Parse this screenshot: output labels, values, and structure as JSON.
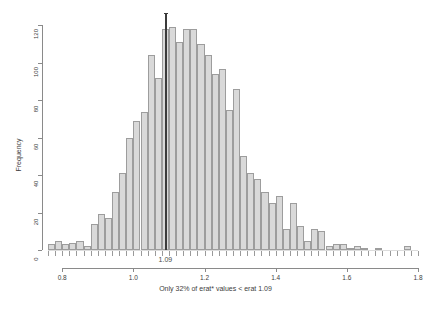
{
  "chart_data": {
    "type": "bar",
    "title": "",
    "subtitle": "",
    "xlabel": "Only 32% of erat* values < erat 1.09",
    "ylabel": "Frequency",
    "xlim": [
      0.76,
      1.8
    ],
    "ylim": [
      0,
      124
    ],
    "grid": false,
    "legend": null,
    "bin_width": 0.02,
    "x_ticks": [
      "0.8",
      "1.0",
      "1.2",
      "1.4",
      "1.6",
      "1.8"
    ],
    "x_tick_values": [
      0.8,
      1.0,
      1.2,
      1.4,
      1.6,
      1.8
    ],
    "y_ticks": [
      "0",
      "20",
      "40",
      "60",
      "80",
      "100",
      "120"
    ],
    "y_tick_values": [
      0,
      20,
      40,
      60,
      80,
      100,
      120
    ],
    "annotations": [
      {
        "name": "erat-reference-line",
        "label": "1.09",
        "x": 1.09,
        "color": "#3b3b3b",
        "orientation": "vertical"
      }
    ],
    "bin_starts": [
      0.76,
      0.78,
      0.8,
      0.82,
      0.84,
      0.86,
      0.88,
      0.9,
      0.92,
      0.94,
      0.96,
      0.98,
      1.0,
      1.02,
      1.04,
      1.06,
      1.08,
      1.1,
      1.12,
      1.14,
      1.16,
      1.18,
      1.2,
      1.22,
      1.24,
      1.26,
      1.28,
      1.3,
      1.32,
      1.34,
      1.36,
      1.38,
      1.4,
      1.42,
      1.44,
      1.46,
      1.48,
      1.5,
      1.52,
      1.54,
      1.56,
      1.58,
      1.6,
      1.62,
      1.64,
      1.66,
      1.68,
      1.7,
      1.72,
      1.74,
      1.76,
      1.78
    ],
    "categories": [
      "0.76",
      "0.78",
      "0.80",
      "0.82",
      "0.84",
      "0.86",
      "0.88",
      "0.90",
      "0.92",
      "0.94",
      "0.96",
      "0.98",
      "1.00",
      "1.02",
      "1.04",
      "1.06",
      "1.08",
      "1.10",
      "1.12",
      "1.14",
      "1.16",
      "1.18",
      "1.20",
      "1.22",
      "1.24",
      "1.26",
      "1.28",
      "1.30",
      "1.32",
      "1.34",
      "1.36",
      "1.38",
      "1.40",
      "1.42",
      "1.44",
      "1.46",
      "1.48",
      "1.50",
      "1.52",
      "1.54",
      "1.56",
      "1.58",
      "1.60",
      "1.62",
      "1.64",
      "1.66",
      "1.68",
      "1.70",
      "1.72",
      "1.74",
      "1.76",
      "1.78"
    ],
    "values": [
      3,
      5,
      3,
      4,
      5,
      2,
      14,
      19,
      17,
      31,
      41,
      60,
      69,
      74,
      104,
      92,
      118,
      119,
      111,
      118,
      118,
      110,
      104,
      94,
      97,
      75,
      86,
      50,
      41,
      38,
      31,
      25,
      29,
      11,
      25,
      13,
      5,
      11,
      10,
      2,
      3,
      3,
      1,
      2,
      1,
      0,
      1,
      0,
      0,
      0,
      2,
      0
    ],
    "bar_fill": "#d9d9d9",
    "bar_border": "#9d9d9d"
  },
  "plot": {
    "y_axis_title": "Frequency",
    "caption": "Only 32% of erat* values < erat 1.09",
    "marker_label": "1.09",
    "background": "#ffffff",
    "axis_color": "#8a8a8a",
    "text_color": "#3d3d3d"
  }
}
